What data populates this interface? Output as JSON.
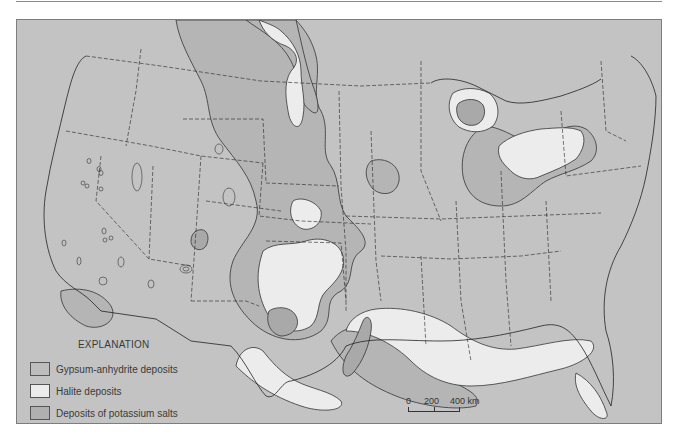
{
  "figure": {
    "title": "",
    "background_color": "#c3c3c3",
    "colors": {
      "gypsum_anhydrite": "#b5b5b5",
      "halite": "#ececec",
      "potassium_salts": "#ababab",
      "outline": "#2e2e2e"
    }
  },
  "legend": {
    "title": "EXPLANATION",
    "items": [
      {
        "label": "Gypsum-anhydrite deposits",
        "swatch": "#bdbdbd"
      },
      {
        "label": "Halite deposits",
        "swatch": "#ececec"
      },
      {
        "label": "Deposits of potassium salts",
        "swatch": "#b0b0b0"
      }
    ]
  },
  "scale_bar": {
    "ticks": [
      "0",
      "200",
      "400 km"
    ]
  }
}
